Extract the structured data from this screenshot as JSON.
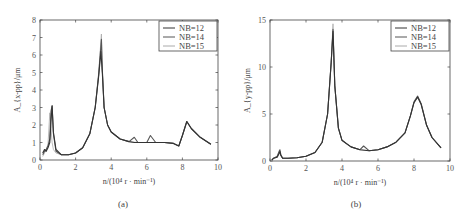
{
  "chart_data": [
    {
      "type": "line",
      "panel_label": "(a)",
      "title": "",
      "xlabel": "n/(10⁴ r · min⁻¹)",
      "ylabel": "A_{x-pp}/μm",
      "xlim": [
        0,
        10
      ],
      "ylim": [
        0,
        8
      ],
      "xticks": [
        0,
        2,
        4,
        6,
        8,
        10
      ],
      "yticks": [
        0,
        1,
        2,
        3,
        4,
        5,
        6,
        7,
        8
      ],
      "grid": false,
      "legend_position": "upper right",
      "legend": [
        "NB=12",
        "NB=14",
        "NB=15"
      ],
      "series": [
        {
          "name": "NB=12",
          "color": "#333333",
          "x": [
            0.15,
            0.25,
            0.35,
            0.45,
            0.55,
            0.62,
            0.68,
            0.75,
            0.9,
            1.2,
            1.6,
            2.0,
            2.4,
            2.8,
            3.1,
            3.3,
            3.42,
            3.5,
            3.6,
            3.8,
            4.0,
            4.5,
            5.0,
            5.3,
            5.5,
            6.0,
            6.2,
            6.5,
            7.0,
            7.5,
            7.8,
            8.0,
            8.25,
            8.5,
            9.0,
            9.6
          ],
          "y": [
            0.4,
            0.6,
            0.5,
            0.7,
            1.0,
            2.2,
            3.1,
            1.6,
            0.6,
            0.3,
            0.3,
            0.4,
            0.7,
            1.5,
            3.0,
            4.8,
            6.2,
            5.0,
            3.0,
            2.0,
            1.6,
            1.2,
            1.05,
            1.0,
            1.0,
            1.0,
            1.0,
            1.0,
            1.0,
            0.95,
            0.8,
            1.4,
            2.2,
            1.8,
            1.3,
            0.9
          ]
        },
        {
          "name": "NB=14",
          "color": "#555555",
          "x": [
            0.15,
            0.25,
            0.35,
            0.45,
            0.55,
            0.62,
            0.68,
            0.75,
            0.9,
            1.2,
            1.6,
            2.0,
            2.4,
            2.8,
            3.1,
            3.3,
            3.45,
            3.5,
            3.6,
            3.8,
            4.0,
            4.5,
            5.0,
            5.3,
            5.5,
            6.0,
            6.2,
            6.5,
            7.0,
            7.5,
            7.8,
            8.0,
            8.25,
            8.5,
            9.0,
            9.6
          ],
          "y": [
            0.3,
            0.5,
            0.6,
            0.8,
            1.2,
            2.8,
            3.1,
            1.5,
            0.5,
            0.3,
            0.3,
            0.4,
            0.7,
            1.5,
            3.0,
            4.9,
            6.9,
            5.2,
            3.0,
            2.0,
            1.6,
            1.2,
            1.05,
            1.3,
            1.0,
            1.0,
            1.4,
            1.0,
            1.0,
            0.95,
            0.8,
            1.4,
            2.2,
            1.8,
            1.3,
            0.9
          ]
        },
        {
          "name": "NB=15",
          "color": "#aaaaaa",
          "x": [
            0.15,
            0.25,
            0.35,
            0.45,
            0.55,
            0.62,
            0.68,
            0.75,
            0.9,
            1.2,
            1.6,
            2.0,
            2.4,
            2.8,
            3.1,
            3.3,
            3.45,
            3.5,
            3.6,
            3.8,
            4.0,
            4.5,
            5.0,
            5.5,
            6.0,
            6.5,
            7.0,
            7.5,
            7.8,
            8.0,
            8.25,
            8.5,
            9.0,
            9.6
          ],
          "y": [
            0.2,
            0.4,
            0.6,
            0.9,
            2.7,
            1.8,
            1.0,
            0.6,
            0.4,
            0.3,
            0.3,
            0.4,
            0.7,
            1.5,
            3.0,
            5.0,
            7.2,
            5.2,
            3.0,
            2.0,
            1.6,
            1.2,
            1.05,
            1.0,
            1.0,
            1.0,
            1.0,
            0.95,
            0.8,
            1.4,
            2.2,
            1.8,
            1.3,
            0.9
          ]
        }
      ]
    },
    {
      "type": "line",
      "panel_label": "(b)",
      "title": "",
      "xlabel": "n/(10⁴ r · min⁻¹)",
      "ylabel": "A_{y-pp}/μm",
      "xlim": [
        0,
        10
      ],
      "ylim": [
        0,
        15
      ],
      "xticks": [
        0,
        2,
        4,
        6,
        8,
        10
      ],
      "yticks": [
        0,
        5,
        10,
        15
      ],
      "grid": false,
      "legend_position": "upper right",
      "legend": [
        "NB=12",
        "NB=14",
        "NB=15"
      ],
      "series": [
        {
          "name": "NB=12",
          "color": "#333333",
          "x": [
            0.1,
            0.2,
            0.4,
            0.5,
            0.55,
            0.6,
            0.7,
            1.0,
            1.5,
            2.0,
            2.5,
            2.9,
            3.2,
            3.4,
            3.5,
            3.6,
            3.8,
            4.0,
            4.5,
            5.0,
            5.5,
            6.0,
            6.5,
            7.0,
            7.5,
            7.8,
            8.0,
            8.2,
            8.4,
            8.7,
            9.0,
            9.5
          ],
          "y": [
            0.1,
            0.3,
            0.4,
            0.8,
            1.0,
            0.6,
            0.3,
            0.3,
            0.35,
            0.5,
            0.9,
            2.0,
            5.0,
            10.5,
            13.8,
            8.0,
            3.5,
            2.2,
            1.5,
            1.2,
            1.1,
            1.2,
            1.5,
            2.0,
            3.0,
            4.8,
            6.2,
            6.8,
            6.0,
            3.8,
            2.5,
            1.4
          ]
        },
        {
          "name": "NB=14",
          "color": "#555555",
          "x": [
            0.1,
            0.2,
            0.4,
            0.5,
            0.55,
            0.6,
            0.7,
            1.0,
            1.5,
            2.0,
            2.5,
            2.9,
            3.2,
            3.4,
            3.5,
            3.6,
            3.8,
            4.0,
            4.2,
            4.5,
            5.0,
            5.2,
            5.5,
            6.0,
            6.5,
            7.0,
            7.5,
            7.8,
            8.0,
            8.2,
            8.4,
            8.7,
            9.0,
            9.5
          ],
          "y": [
            0.1,
            0.3,
            0.5,
            1.0,
            1.2,
            0.7,
            0.3,
            0.3,
            0.35,
            0.5,
            0.9,
            2.0,
            5.0,
            10.5,
            14.0,
            8.0,
            3.5,
            2.2,
            1.9,
            1.5,
            1.2,
            1.6,
            1.1,
            1.2,
            1.5,
            2.0,
            3.0,
            4.8,
            6.3,
            6.9,
            6.1,
            3.8,
            2.5,
            1.4
          ]
        },
        {
          "name": "NB=15",
          "color": "#aaaaaa",
          "x": [
            0.1,
            0.2,
            0.4,
            0.5,
            0.55,
            0.6,
            0.7,
            1.0,
            1.5,
            2.0,
            2.5,
            2.9,
            3.2,
            3.4,
            3.5,
            3.6,
            3.8,
            4.0,
            4.5,
            5.0,
            5.5,
            6.0,
            6.5,
            7.0,
            7.5,
            7.8,
            8.0,
            8.2,
            8.4,
            8.7,
            9.0,
            9.5
          ],
          "y": [
            0.1,
            0.3,
            0.4,
            0.7,
            0.9,
            0.6,
            0.3,
            0.3,
            0.35,
            0.5,
            0.9,
            2.0,
            5.0,
            10.5,
            14.6,
            8.0,
            3.5,
            2.2,
            1.5,
            1.2,
            1.1,
            1.2,
            1.5,
            2.0,
            3.0,
            4.8,
            6.2,
            6.8,
            6.0,
            3.8,
            2.5,
            1.4
          ]
        }
      ]
    }
  ]
}
